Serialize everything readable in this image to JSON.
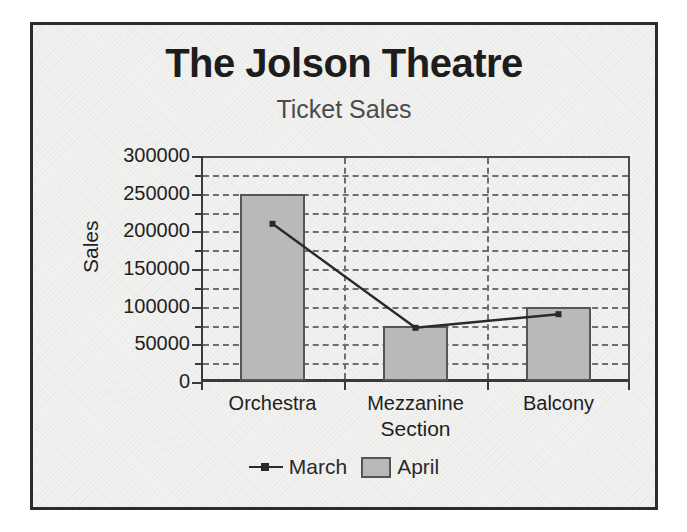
{
  "chart_data": {
    "type": "bar",
    "title": "The Jolson Theatre",
    "subtitle": "Ticket Sales",
    "xlabel": "Section",
    "ylabel": "Sales",
    "categories": [
      "Orchestra",
      "Mezzanine",
      "Balcony"
    ],
    "ylim": [
      0,
      300000
    ],
    "ytick_labels": [
      "300000",
      "250000",
      "200000",
      "150000",
      "100000",
      "50000",
      "0"
    ],
    "ytick_values": [
      300000,
      250000,
      200000,
      150000,
      100000,
      50000,
      0
    ],
    "minor_tick_interval": 25000,
    "grid": "horizontal dashed at 25000 intervals, vertical dashed at category boundaries",
    "legend_position": "bottom-center",
    "series": [
      {
        "name": "March",
        "type": "line",
        "marker": "square",
        "color": "#2a2a2a",
        "values": [
          210000,
          72000,
          90000
        ]
      },
      {
        "name": "April",
        "type": "bar",
        "color": "#b9b9b9",
        "values": [
          250000,
          75000,
          100000
        ]
      }
    ]
  },
  "legend": {
    "entries": [
      {
        "label": "March",
        "key": "line-marker-key"
      },
      {
        "label": "April",
        "key": "swatch-key"
      }
    ]
  }
}
